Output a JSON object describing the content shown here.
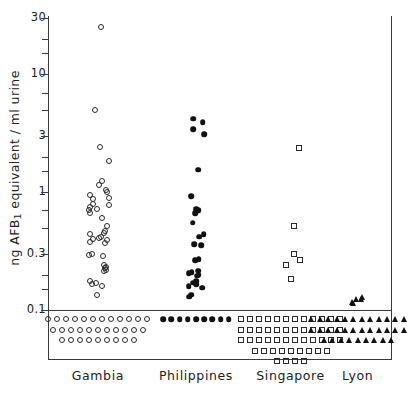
{
  "chart_data": {
    "type": "scatter",
    "title": "",
    "xlabel": "",
    "ylabel": "ng AFB1 equivalent / ml urine",
    "ylabel_prefix": "ng AFB",
    "ylabel_sub": "1",
    "ylabel_suffix": " equivalent / ml urine",
    "yscale": "log",
    "ylim": [
      0.055,
      30
    ],
    "ytick_labels": [
      "30",
      "10",
      "3",
      "1",
      "0.3",
      "0.1"
    ],
    "ytick_values": [
      30,
      10,
      3,
      1,
      0.3,
      0.1
    ],
    "minor_ticks": [
      20,
      15,
      7,
      5,
      2,
      1.5,
      0.7,
      0.5,
      0.2,
      0.15
    ],
    "grid": false,
    "legend": "none",
    "detection_limit": 0.1,
    "detection_limit_note": "markers plotted below the 0.1 line are non-detects",
    "categories": [
      "Gambia",
      "Philippines",
      "Singapore",
      "Lyon"
    ],
    "series": [
      {
        "name": "Gambia",
        "marker": "open-circle",
        "color": "#2b2b2b",
        "x_center": 0.145,
        "detected_values": [
          25.0,
          5.0,
          2.4,
          1.85,
          1.25,
          1.15,
          1.05,
          1.0,
          0.95,
          0.9,
          0.88,
          0.8,
          0.78,
          0.75,
          0.72,
          0.7,
          0.66,
          0.6,
          0.52,
          0.47,
          0.45,
          0.44,
          0.42,
          0.41,
          0.4,
          0.39,
          0.38,
          0.37,
          0.3,
          0.29,
          0.285,
          0.24,
          0.23,
          0.225,
          0.22,
          0.215,
          0.175,
          0.17,
          0.165,
          0.16,
          0.135
        ],
        "below_limit_count": 32,
        "below_limit_rows": [
          12,
          11,
          9
        ]
      },
      {
        "name": "Philippines",
        "marker": "filled-circle",
        "color": "#111111",
        "x_center": 0.43,
        "detected_values": [
          4.2,
          3.9,
          3.4,
          3.1,
          1.55,
          0.92,
          0.72,
          0.7,
          0.66,
          0.55,
          0.44,
          0.42,
          0.36,
          0.355,
          0.27,
          0.265,
          0.215,
          0.21,
          0.205,
          0.2,
          0.195,
          0.175,
          0.17,
          0.165,
          0.16,
          0.155,
          0.135,
          0.13
        ],
        "below_limit_count": 9,
        "below_limit_rows": [
          9
        ]
      },
      {
        "name": "Singapore",
        "marker": "open-square",
        "color": "#2b2b2b",
        "x_center": 0.705,
        "detected_values": [
          2.35,
          0.52,
          0.3,
          0.265,
          0.24,
          0.185
        ],
        "below_limit_count": 49,
        "below_limit_rows": [
          12,
          12,
          12,
          9,
          4
        ]
      },
      {
        "name": "Lyon",
        "marker": "filled-triangle",
        "color": "#111111",
        "x_center": 0.9,
        "detected_values": [
          0.125,
          0.125,
          0.128,
          0.115,
          0.118
        ],
        "below_limit_count": 33,
        "below_limit_rows": [
          12,
          12,
          9
        ]
      }
    ]
  }
}
